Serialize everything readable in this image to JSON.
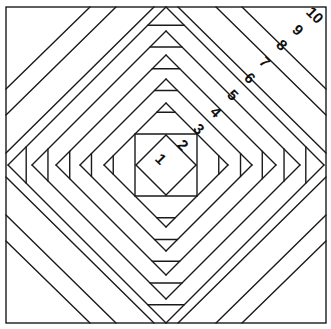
{
  "diagram": {
    "outer_square": {
      "x": 6,
      "y": 7,
      "w": 320,
      "h": 316
    },
    "center": {
      "x": 166,
      "y": 165
    },
    "piece_labels": [
      {
        "label": "1",
        "x": 160,
        "y": 160
      },
      {
        "label": "2",
        "x": 182,
        "y": 146
      },
      {
        "label": "3",
        "x": 198,
        "y": 130
      },
      {
        "label": "4",
        "x": 215,
        "y": 113
      },
      {
        "label": "5",
        "x": 232,
        "y": 96
      },
      {
        "label": "6",
        "x": 249,
        "y": 79
      },
      {
        "label": "7",
        "x": 264,
        "y": 63
      },
      {
        "label": "8",
        "x": 281,
        "y": 46
      },
      {
        "label": "9",
        "x": 297,
        "y": 31
      },
      {
        "label": "10",
        "x": 314,
        "y": 16
      }
    ],
    "line_color": "#1a1a1a",
    "background": "#ffffff"
  }
}
